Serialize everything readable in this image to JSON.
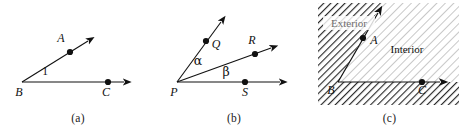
{
  "figure": {
    "background_color": "#ffffff",
    "line_color": "#111111",
    "panels": [
      {
        "id": "a",
        "caption": "(a)",
        "vertex_label": "B",
        "point_labels": [
          "A",
          "C"
        ],
        "angle_label": "1",
        "rays": [
          "BA",
          "BC"
        ]
      },
      {
        "id": "b",
        "caption": "(b)",
        "vertex_label": "P",
        "point_labels": [
          "Q",
          "R",
          "S"
        ],
        "angle_labels": [
          "α",
          "β"
        ],
        "rays": [
          "PQ",
          "PR",
          "PS"
        ]
      },
      {
        "id": "c",
        "caption": "(c)",
        "vertex_label": "B",
        "point_labels": [
          "A",
          "C"
        ],
        "region_labels": [
          "Exterior",
          "Interior"
        ],
        "rays": [
          "BA",
          "BC"
        ]
      }
    ]
  },
  "panel_a": {
    "caption": "(a)",
    "label_A": "A",
    "label_B": "B",
    "label_C": "C",
    "label_angle_1": "1"
  },
  "panel_b": {
    "caption": "(b)",
    "label_P": "P",
    "label_Q": "Q",
    "label_R": "R",
    "label_S": "S",
    "label_alpha": "α",
    "label_beta": "β"
  },
  "panel_c": {
    "caption": "(c)",
    "label_A": "A",
    "label_B": "B",
    "label_C": "C",
    "label_exterior": "Exterior",
    "label_interior": "Interior"
  },
  "colors": {
    "ink": "#111111",
    "hatch_dark": "#2b2b2b",
    "hatch_light": "#9a9a9a",
    "faded_text": "#6e6e6e",
    "panel_background": "#ffffff"
  }
}
